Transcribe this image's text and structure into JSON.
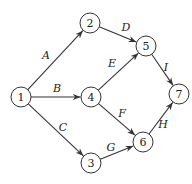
{
  "graph": {
    "type": "directed",
    "node_radius": 10,
    "nodes": [
      {
        "id": "1",
        "label": "1",
        "x": 21,
        "y": 97
      },
      {
        "id": "2",
        "label": "2",
        "x": 90,
        "y": 23
      },
      {
        "id": "3",
        "label": "3",
        "x": 91,
        "y": 163
      },
      {
        "id": "4",
        "label": "4",
        "x": 91,
        "y": 97
      },
      {
        "id": "5",
        "label": "5",
        "x": 146,
        "y": 46
      },
      {
        "id": "6",
        "label": "6",
        "x": 143,
        "y": 142
      },
      {
        "id": "7",
        "label": "7",
        "x": 179,
        "y": 94
      }
    ],
    "edges": [
      {
        "label": "A",
        "from": "1",
        "to": "2",
        "lx": 46,
        "ly": 55
      },
      {
        "label": "B",
        "from": "1",
        "to": "4",
        "lx": 57,
        "ly": 88
      },
      {
        "label": "C",
        "from": "1",
        "to": "3",
        "lx": 63,
        "ly": 127
      },
      {
        "label": "D",
        "from": "2",
        "to": "5",
        "lx": 126,
        "ly": 27
      },
      {
        "label": "E",
        "from": "4",
        "to": "5",
        "lx": 112,
        "ly": 63
      },
      {
        "label": "F",
        "from": "4",
        "to": "6",
        "lx": 122,
        "ly": 113
      },
      {
        "label": "G",
        "from": "3",
        "to": "6",
        "lx": 111,
        "ly": 147
      },
      {
        "label": "H",
        "from": "6",
        "to": "7",
        "lx": 163,
        "ly": 124
      },
      {
        "label": "I",
        "from": "5",
        "to": "7",
        "lx": 166,
        "ly": 67
      }
    ]
  }
}
